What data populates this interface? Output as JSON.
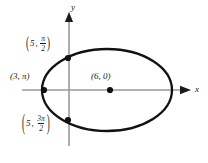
{
  "figure": {
    "background_color": "#ffffff",
    "curve_color": "#111111",
    "axis_color": "#9a9a9a",
    "point_color": "#111111",
    "text_color": "#1a1a1a"
  },
  "axes": {
    "x_label": "x",
    "y_label": "y",
    "x_axis": {
      "x_start": 22,
      "x_end": 183,
      "y": 90,
      "arrow": "right"
    },
    "y_axis": {
      "y_start": 18,
      "y_end": 146,
      "x": 69,
      "arrow": "up"
    }
  },
  "curve": {
    "type": "closed-oval",
    "center_px": {
      "x": 107,
      "y": 90
    },
    "radius_x_px": 65,
    "radius_y_px": 41
  },
  "points": [
    {
      "name": "top-point",
      "label_r": "5",
      "label_theta_numerator": "π",
      "label_theta_denominator": "2",
      "px": {
        "x": 68,
        "y": 58
      }
    },
    {
      "name": "left-point",
      "label_r": "3",
      "label_theta": "π",
      "label_text": "(3, π)",
      "px": {
        "x": 44,
        "y": 90
      }
    },
    {
      "name": "center-point",
      "label_r": "6",
      "label_theta": "0",
      "label_text": "(6, 0)",
      "px": {
        "x": 110,
        "y": 90
      }
    },
    {
      "name": "bottom-point",
      "label_r": "5",
      "label_theta_numerator": "3π",
      "label_theta_denominator": "2",
      "px": {
        "x": 68,
        "y": 120
      }
    }
  ],
  "annotations": {
    "open_paren": "(",
    "close_paren": ")",
    "comma": ","
  }
}
